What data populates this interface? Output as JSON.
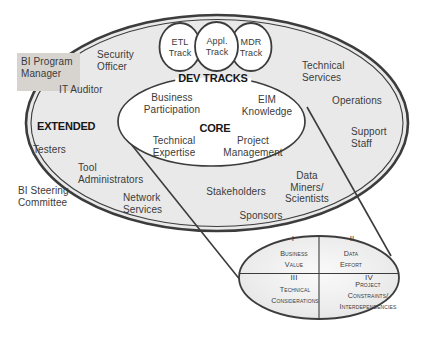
{
  "colors": {
    "outer_ellipse_fill": "#e9e9e9",
    "stroke": "#3c3c3c",
    "core_fill": "#ffffff",
    "program_manager_box_fill": "#d7d4cf",
    "text": "#3b3b3b"
  },
  "external_roles": {
    "bi_program_manager": "BI Program\nManager",
    "bi_steering_committee": "BI Steering\nCommittee"
  },
  "extended_zone": {
    "label": "EXTENDED",
    "roles": {
      "security_officer": "Security\nOfficer",
      "it_auditor": "IT Auditor",
      "testers": "Testers",
      "tool_administrators": "Tool\nAdministrators",
      "network_services": "Network\nServices",
      "technical_services": "Technical\nServices",
      "operations": "Operations",
      "support_staff": "Support\nStaff",
      "data_miners_scientists": "Data\nMiners/\nScientists",
      "stakeholders": "Stakeholders",
      "sponsors": "Sponsors"
    }
  },
  "core_zone": {
    "label": "CORE",
    "roles": {
      "business_participation": "Business\nParticipation",
      "eim_knowledge": "EIM\nKnowledge",
      "technical_expertise": "Technical\nExpertise",
      "project_management": "Project\nManagement"
    }
  },
  "dev_tracks": {
    "label": "DEV TRACKS",
    "tracks": {
      "etl": "ETL\nTrack",
      "appl": "Appl.\nTrack",
      "mdr": "MDR\nTrack"
    }
  },
  "quadrant_chart": {
    "q1": {
      "numeral": "I",
      "label": "Business\nValue"
    },
    "q2": {
      "numeral": "II",
      "label": "Data\nEffort"
    },
    "q3": {
      "numeral": "III",
      "label": "Technical\nConsiderations"
    },
    "q4": {
      "numeral": "IV",
      "label": "Project Constraints/\nInterdependencies"
    }
  }
}
